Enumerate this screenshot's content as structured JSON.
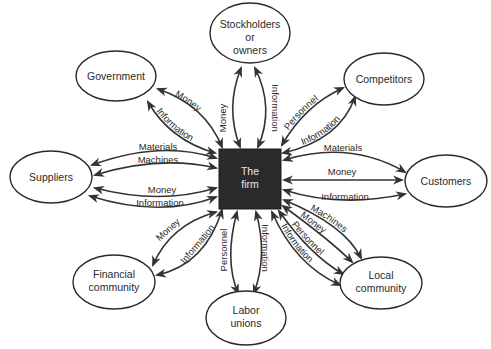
{
  "diagram": {
    "center": {
      "label_line1": "The",
      "label_line2": "firm",
      "fill": "#2b2b2b"
    },
    "nodes": {
      "stockholders": {
        "line1": "Stockholders",
        "line2": "or",
        "line3": "owners"
      },
      "government": {
        "line1": "Government"
      },
      "competitors": {
        "line1": "Competitors"
      },
      "suppliers": {
        "line1": "Suppliers"
      },
      "customers": {
        "line1": "Customers"
      },
      "financial": {
        "line1": "Financial",
        "line2": "community"
      },
      "labor": {
        "line1": "Labor",
        "line2": "unions"
      },
      "local": {
        "line1": "Local",
        "line2": "community"
      }
    },
    "flows": {
      "government": [
        "Money",
        "Information"
      ],
      "stockholders": [
        "Money",
        "Information"
      ],
      "competitors": [
        "Personnel",
        "Information"
      ],
      "suppliers": [
        "Materials",
        "Machines",
        "Money",
        "Information"
      ],
      "customers": [
        "Materials",
        "Money",
        "Information"
      ],
      "financial": [
        "Money",
        "Information"
      ],
      "labor": [
        "Personnel",
        "Information"
      ],
      "local": [
        "Machines",
        "Money",
        "Personnel",
        "Information"
      ]
    }
  }
}
